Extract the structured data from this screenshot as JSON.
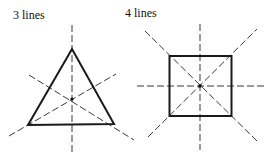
{
  "figure": {
    "topic": "lines of symmetry",
    "panels": [
      {
        "label": "3 lines",
        "shape": "equilateral triangle",
        "symmetry_lines": 3
      },
      {
        "label": "4 lines",
        "shape": "square",
        "symmetry_lines": 4
      }
    ]
  },
  "colors": {
    "stroke": "#1a1a1a",
    "background": "#ffffff"
  }
}
